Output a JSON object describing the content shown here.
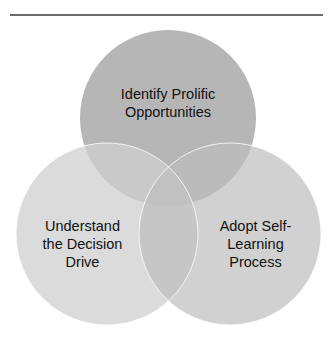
{
  "diagram": {
    "type": "venn",
    "circles": [
      {
        "id": "top",
        "label": "Identify Prolific\nOpportunities",
        "fill": "#a9a9a9"
      },
      {
        "id": "left",
        "label": "Understand\nthe Decision\nDrive",
        "fill": "#d2d2d2"
      },
      {
        "id": "right",
        "label": "Adopt Self-\nLearning\nProcess",
        "fill": "#c4c4c4"
      }
    ],
    "rule_color": "#6b6b6b",
    "stroke_color": "#ffffff"
  }
}
